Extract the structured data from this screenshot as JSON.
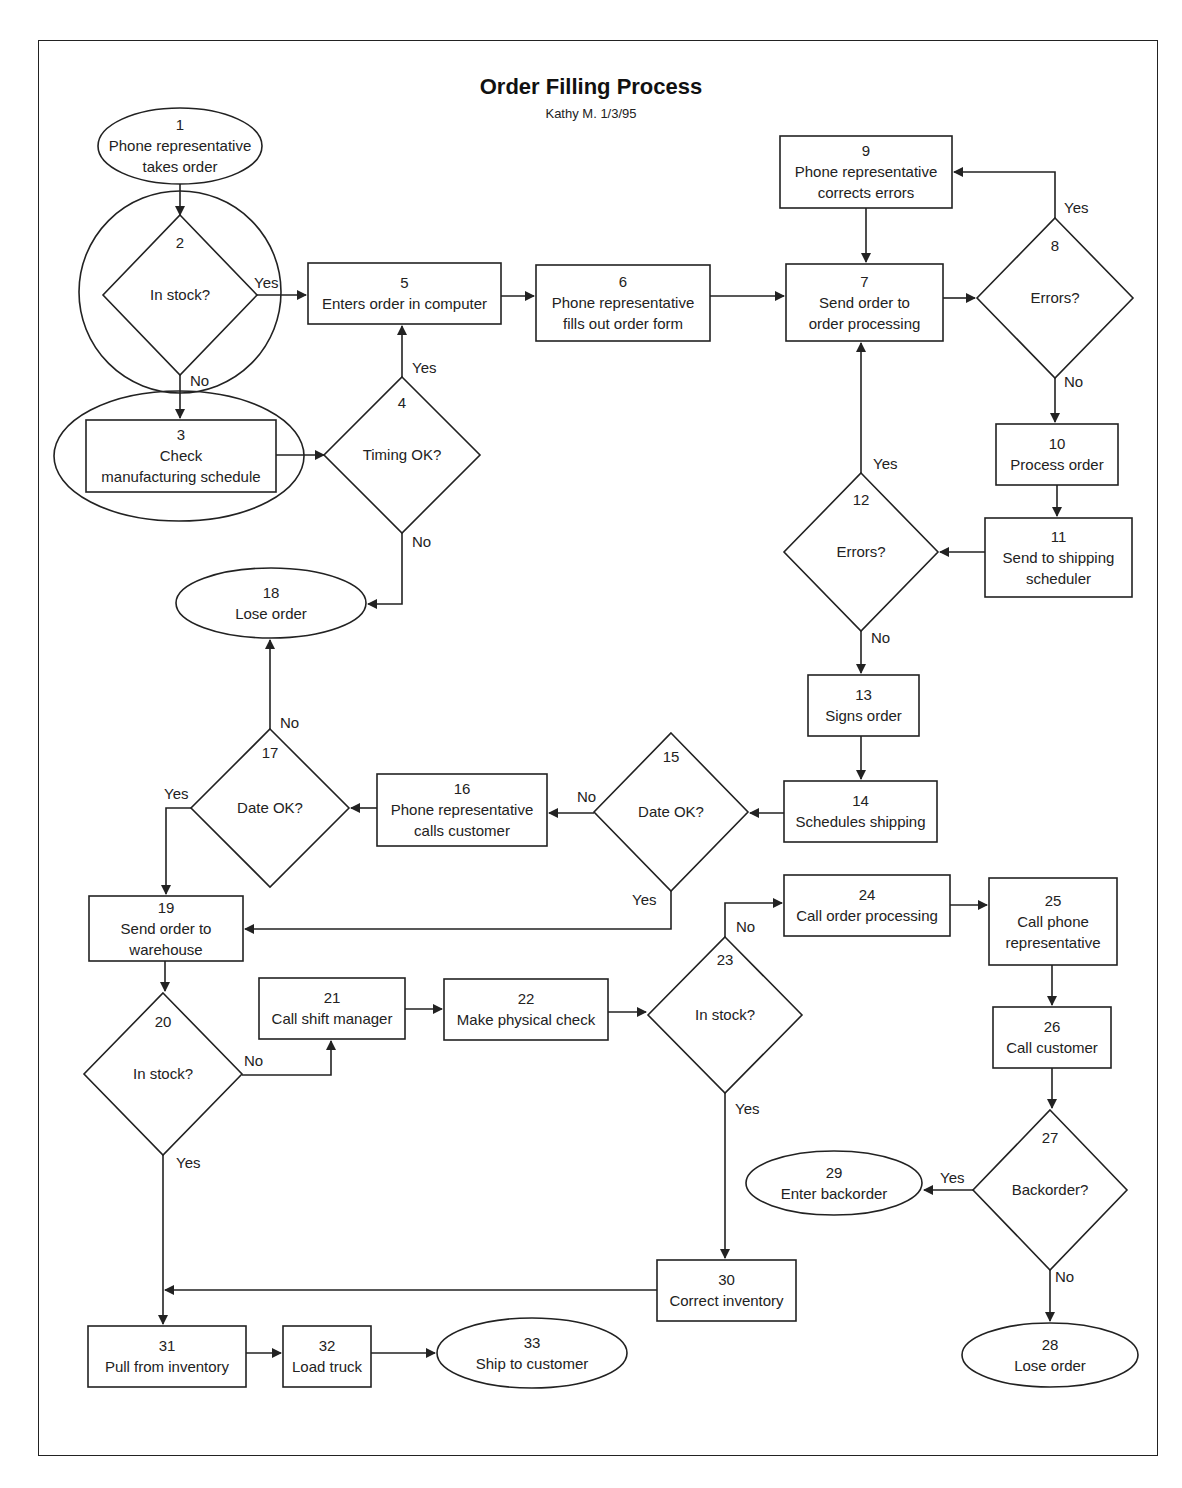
{
  "diagram": {
    "title": "Order Filling Process",
    "subtitle": "Kathy M. 1/3/95",
    "stroke_color": "#222222",
    "background": "#ffffff"
  },
  "nodes": [
    {
      "id": "1",
      "shape": "ellipse",
      "cx": 180,
      "cy": 146,
      "rx": 82,
      "ry": 38,
      "lines": [
        "1",
        "Phone representative",
        "takes order"
      ]
    },
    {
      "id": "2c",
      "shape": "circle",
      "cx": 180,
      "cy": 292,
      "r": 101,
      "lines": []
    },
    {
      "id": "2",
      "shape": "diamond",
      "cx": 180,
      "cy": 295,
      "hw": 77,
      "hh": 80,
      "lines": [
        "2",
        "In stock?"
      ],
      "text_offsets": [
        -52,
        0
      ]
    },
    {
      "id": "3e",
      "shape": "ellipse",
      "cx": 179,
      "cy": 456,
      "rx": 125,
      "ry": 65,
      "lines": []
    },
    {
      "id": "3",
      "shape": "rect",
      "x": 86,
      "y": 420,
      "w": 190,
      "h": 72,
      "lines": [
        "3",
        "Check",
        "manufacturing schedule"
      ]
    },
    {
      "id": "4",
      "shape": "diamond",
      "cx": 402,
      "cy": 455,
      "hw": 78,
      "hh": 78,
      "lines": [
        "4",
        "Timing OK?"
      ],
      "text_offsets": [
        -52,
        0
      ]
    },
    {
      "id": "5",
      "shape": "rect",
      "x": 308,
      "y": 263,
      "w": 193,
      "h": 61,
      "lines": [
        "5",
        "Enters order in computer"
      ]
    },
    {
      "id": "6",
      "shape": "rect",
      "x": 536,
      "y": 265,
      "w": 174,
      "h": 76,
      "lines": [
        "6",
        "Phone representative",
        "fills out order form"
      ]
    },
    {
      "id": "7",
      "shape": "rect",
      "x": 786,
      "y": 264,
      "w": 157,
      "h": 77,
      "lines": [
        "7",
        "Send order to",
        "order processing"
      ]
    },
    {
      "id": "8",
      "shape": "diamond",
      "cx": 1055,
      "cy": 298,
      "hw": 78,
      "hh": 80,
      "lines": [
        "8",
        "Errors?"
      ],
      "text_offsets": [
        -52,
        0
      ]
    },
    {
      "id": "9",
      "shape": "rect",
      "x": 780,
      "y": 136,
      "w": 172,
      "h": 72,
      "lines": [
        "9",
        "Phone representative",
        "corrects errors"
      ]
    },
    {
      "id": "10",
      "shape": "rect",
      "x": 996,
      "y": 424,
      "w": 122,
      "h": 61,
      "lines": [
        "10",
        "Process order"
      ]
    },
    {
      "id": "11",
      "shape": "rect",
      "x": 985,
      "y": 518,
      "w": 147,
      "h": 79,
      "lines": [
        "11",
        "Send to shipping",
        "scheduler"
      ]
    },
    {
      "id": "12",
      "shape": "diamond",
      "cx": 861,
      "cy": 552,
      "hw": 77,
      "hh": 79,
      "lines": [
        "12",
        "Errors?"
      ],
      "text_offsets": [
        -52,
        0
      ]
    },
    {
      "id": "13",
      "shape": "rect",
      "x": 808,
      "y": 675,
      "w": 111,
      "h": 61,
      "lines": [
        "13",
        "Signs order"
      ]
    },
    {
      "id": "14",
      "shape": "rect",
      "x": 784,
      "y": 781,
      "w": 153,
      "h": 61,
      "lines": [
        "14",
        "Schedules shipping"
      ]
    },
    {
      "id": "15",
      "shape": "diamond",
      "cx": 671,
      "cy": 812,
      "hw": 77,
      "hh": 79,
      "lines": [
        "15",
        "Date OK?"
      ],
      "text_offsets": [
        -55,
        0
      ]
    },
    {
      "id": "16",
      "shape": "rect",
      "x": 377,
      "y": 774,
      "w": 170,
      "h": 72,
      "lines": [
        "16",
        "Phone representative",
        "calls customer"
      ]
    },
    {
      "id": "17",
      "shape": "diamond",
      "cx": 270,
      "cy": 808,
      "hw": 79,
      "hh": 79,
      "lines": [
        "17",
        "Date OK?"
      ],
      "text_offsets": [
        -55,
        0
      ]
    },
    {
      "id": "18",
      "shape": "ellipse",
      "cx": 271,
      "cy": 603,
      "rx": 95,
      "ry": 35,
      "lines": [
        "18",
        "Lose order"
      ]
    },
    {
      "id": "19",
      "shape": "rect",
      "x": 89,
      "y": 896,
      "w": 154,
      "h": 65,
      "lines": [
        "19",
        "Send order to",
        "warehouse"
      ]
    },
    {
      "id": "20",
      "shape": "diamond",
      "cx": 163,
      "cy": 1074,
      "hw": 79,
      "hh": 81,
      "lines": [
        "20",
        "In stock?"
      ],
      "text_offsets": [
        -52,
        0
      ]
    },
    {
      "id": "21",
      "shape": "rect",
      "x": 259,
      "y": 978,
      "w": 146,
      "h": 61,
      "lines": [
        "21",
        "Call shift manager"
      ]
    },
    {
      "id": "22",
      "shape": "rect",
      "x": 444,
      "y": 979,
      "w": 164,
      "h": 61,
      "lines": [
        "22",
        "Make physical check"
      ]
    },
    {
      "id": "23",
      "shape": "diamond",
      "cx": 725,
      "cy": 1015,
      "hw": 77,
      "hh": 78,
      "lines": [
        "23",
        "In stock?"
      ],
      "text_offsets": [
        -55,
        0
      ]
    },
    {
      "id": "24",
      "shape": "rect",
      "x": 784,
      "y": 875,
      "w": 166,
      "h": 61,
      "lines": [
        "24",
        "Call order processing"
      ]
    },
    {
      "id": "25",
      "shape": "rect",
      "x": 989,
      "y": 878,
      "w": 128,
      "h": 87,
      "lines": [
        "25",
        "Call phone",
        "representative"
      ]
    },
    {
      "id": "26",
      "shape": "rect",
      "x": 993,
      "y": 1007,
      "w": 118,
      "h": 61,
      "lines": [
        "26",
        "Call customer"
      ]
    },
    {
      "id": "27",
      "shape": "diamond",
      "cx": 1050,
      "cy": 1190,
      "hw": 77,
      "hh": 80,
      "lines": [
        "27",
        "Backorder?"
      ],
      "text_offsets": [
        -52,
        0
      ]
    },
    {
      "id": "28",
      "shape": "ellipse",
      "cx": 1050,
      "cy": 1355,
      "rx": 88,
      "ry": 32,
      "lines": [
        "28",
        "Lose order"
      ]
    },
    {
      "id": "29",
      "shape": "ellipse",
      "cx": 834,
      "cy": 1183,
      "rx": 88,
      "ry": 32,
      "lines": [
        "29",
        "Enter backorder"
      ]
    },
    {
      "id": "30",
      "shape": "rect",
      "x": 657,
      "y": 1260,
      "w": 139,
      "h": 61,
      "lines": [
        "30",
        "Correct inventory"
      ]
    },
    {
      "id": "31",
      "shape": "rect",
      "x": 88,
      "y": 1326,
      "w": 158,
      "h": 61,
      "lines": [
        "31",
        "Pull from inventory"
      ]
    },
    {
      "id": "32",
      "shape": "rect",
      "x": 283,
      "y": 1326,
      "w": 88,
      "h": 61,
      "lines": [
        "32",
        "Load truck"
      ]
    },
    {
      "id": "33",
      "shape": "ellipse",
      "cx": 532,
      "cy": 1353,
      "rx": 95,
      "ry": 35,
      "lines": [
        "33",
        "Ship to customer"
      ]
    }
  ],
  "edges": [
    {
      "from": "1",
      "to": "2",
      "points": [
        [
          180,
          184
        ],
        [
          180,
          215
        ]
      ],
      "arrow": true
    },
    {
      "from": "2",
      "to": "5",
      "points": [
        [
          257,
          295
        ],
        [
          306,
          295
        ]
      ],
      "arrow": true,
      "label": "Yes",
      "label_pos": [
        254,
        288
      ]
    },
    {
      "from": "2",
      "to": "3",
      "points": [
        [
          180,
          375
        ],
        [
          180,
          418
        ]
      ],
      "arrow": true,
      "label": "No",
      "label_pos": [
        190,
        386
      ]
    },
    {
      "from": "3",
      "to": "4",
      "points": [
        [
          276,
          455
        ],
        [
          324,
          455
        ]
      ],
      "arrow": true
    },
    {
      "from": "4",
      "to": "5",
      "points": [
        [
          402,
          377
        ],
        [
          402,
          326
        ]
      ],
      "arrow": true,
      "label": "Yes",
      "label_pos": [
        412,
        373
      ]
    },
    {
      "from": "4",
      "to": "18",
      "points": [
        [
          402,
          533
        ],
        [
          402,
          604
        ],
        [
          368,
          604
        ]
      ],
      "arrow": true,
      "label": "No",
      "label_pos": [
        412,
        547
      ]
    },
    {
      "from": "5",
      "to": "6",
      "points": [
        [
          501,
          296
        ],
        [
          534,
          296
        ]
      ],
      "arrow": true
    },
    {
      "from": "6",
      "to": "7",
      "points": [
        [
          710,
          296
        ],
        [
          784,
          296
        ]
      ],
      "arrow": true
    },
    {
      "from": "7",
      "to": "8",
      "points": [
        [
          943,
          298
        ],
        [
          975,
          298
        ]
      ],
      "arrow": true
    },
    {
      "from": "8",
      "to": "9",
      "points": [
        [
          1055,
          218
        ],
        [
          1055,
          172
        ],
        [
          954,
          172
        ]
      ],
      "arrow": true,
      "label": "Yes",
      "label_pos": [
        1064,
        213
      ]
    },
    {
      "from": "8",
      "to": "10",
      "points": [
        [
          1055,
          378
        ],
        [
          1055,
          422
        ]
      ],
      "arrow": true,
      "label": "No",
      "label_pos": [
        1064,
        387
      ]
    },
    {
      "from": "9",
      "to": "7",
      "points": [
        [
          866,
          208
        ],
        [
          866,
          262
        ]
      ],
      "arrow": true
    },
    {
      "from": "10",
      "to": "11",
      "points": [
        [
          1057,
          485
        ],
        [
          1057,
          516
        ]
      ],
      "arrow": true
    },
    {
      "from": "11",
      "to": "12",
      "points": [
        [
          985,
          552
        ],
        [
          940,
          552
        ]
      ],
      "arrow": true
    },
    {
      "from": "12",
      "to": "7",
      "points": [
        [
          861,
          473
        ],
        [
          861,
          343
        ]
      ],
      "arrow": true,
      "label": "Yes",
      "label_pos": [
        873,
        469
      ]
    },
    {
      "from": "12",
      "to": "13",
      "points": [
        [
          861,
          631
        ],
        [
          861,
          673
        ]
      ],
      "arrow": true,
      "label": "No",
      "label_pos": [
        871,
        643
      ]
    },
    {
      "from": "13",
      "to": "14",
      "points": [
        [
          861,
          736
        ],
        [
          861,
          779
        ]
      ],
      "arrow": true
    },
    {
      "from": "14",
      "to": "15",
      "points": [
        [
          784,
          813
        ],
        [
          750,
          813
        ]
      ],
      "arrow": true
    },
    {
      "from": "15",
      "to": "16",
      "points": [
        [
          594,
          813
        ],
        [
          549,
          813
        ]
      ],
      "arrow": true,
      "label": "No",
      "label_pos": [
        577,
        802
      ]
    },
    {
      "from": "15",
      "to": "19",
      "points": [
        [
          671,
          891
        ],
        [
          671,
          929
        ],
        [
          245,
          929
        ]
      ],
      "arrow": true,
      "label": "Yes",
      "label_pos": [
        632,
        905
      ]
    },
    {
      "from": "16",
      "to": "17",
      "points": [
        [
          377,
          808
        ],
        [
          351,
          808
        ]
      ],
      "arrow": true
    },
    {
      "from": "17",
      "to": "18",
      "points": [
        [
          270,
          729
        ],
        [
          270,
          640
        ]
      ],
      "arrow": true,
      "label": "No",
      "label_pos": [
        280,
        728
      ]
    },
    {
      "from": "17",
      "to": "19",
      "points": [
        [
          191,
          808
        ],
        [
          166,
          808
        ],
        [
          166,
          894
        ]
      ],
      "arrow": true,
      "label": "Yes",
      "label_pos": [
        164,
        799
      ]
    },
    {
      "from": "19",
      "to": "20",
      "points": [
        [
          165,
          961
        ],
        [
          165,
          991
        ]
      ],
      "arrow": true
    },
    {
      "from": "20",
      "to": "21",
      "points": [
        [
          242,
          1075
        ],
        [
          331,
          1075
        ],
        [
          331,
          1041
        ]
      ],
      "arrow": true,
      "label": "No",
      "label_pos": [
        244,
        1066
      ]
    },
    {
      "from": "20",
      "to": "31",
      "points": [
        [
          163,
          1155
        ],
        [
          163,
          1324
        ]
      ],
      "arrow": true,
      "label": "Yes",
      "label_pos": [
        176,
        1168
      ]
    },
    {
      "from": "21",
      "to": "22",
      "points": [
        [
          405,
          1009
        ],
        [
          442,
          1009
        ]
      ],
      "arrow": true
    },
    {
      "from": "22",
      "to": "23",
      "points": [
        [
          608,
          1012
        ],
        [
          646,
          1012
        ]
      ],
      "arrow": true
    },
    {
      "from": "23",
      "to": "24",
      "points": [
        [
          725,
          937
        ],
        [
          725,
          903
        ],
        [
          782,
          903
        ]
      ],
      "arrow": true,
      "label": "No",
      "label_pos": [
        736,
        932
      ]
    },
    {
      "from": "23",
      "to": "30",
      "points": [
        [
          725,
          1093
        ],
        [
          725,
          1258
        ]
      ],
      "arrow": true,
      "label": "Yes",
      "label_pos": [
        735,
        1114
      ]
    },
    {
      "from": "24",
      "to": "25",
      "points": [
        [
          950,
          905
        ],
        [
          987,
          905
        ]
      ],
      "arrow": true
    },
    {
      "from": "25",
      "to": "26",
      "points": [
        [
          1052,
          965
        ],
        [
          1052,
          1005
        ]
      ],
      "arrow": true
    },
    {
      "from": "26",
      "to": "27",
      "points": [
        [
          1052,
          1068
        ],
        [
          1052,
          1108
        ]
      ],
      "arrow": true
    },
    {
      "from": "27",
      "to": "29",
      "points": [
        [
          973,
          1190
        ],
        [
          924,
          1190
        ]
      ],
      "arrow": true,
      "label": "Yes",
      "label_pos": [
        940,
        1183
      ]
    },
    {
      "from": "27",
      "to": "28",
      "points": [
        [
          1050,
          1270
        ],
        [
          1050,
          1321
        ]
      ],
      "arrow": true,
      "label": "No",
      "label_pos": [
        1055,
        1282
      ]
    },
    {
      "from": "30",
      "to": "31",
      "points": [
        [
          657,
          1290
        ],
        [
          165,
          1290
        ]
      ],
      "arrow": true
    },
    {
      "from": "31",
      "to": "32",
      "points": [
        [
          246,
          1353
        ],
        [
          281,
          1353
        ]
      ],
      "arrow": true
    },
    {
      "from": "32",
      "to": "33",
      "points": [
        [
          371,
          1353
        ],
        [
          435,
          1353
        ]
      ],
      "arrow": true
    }
  ]
}
